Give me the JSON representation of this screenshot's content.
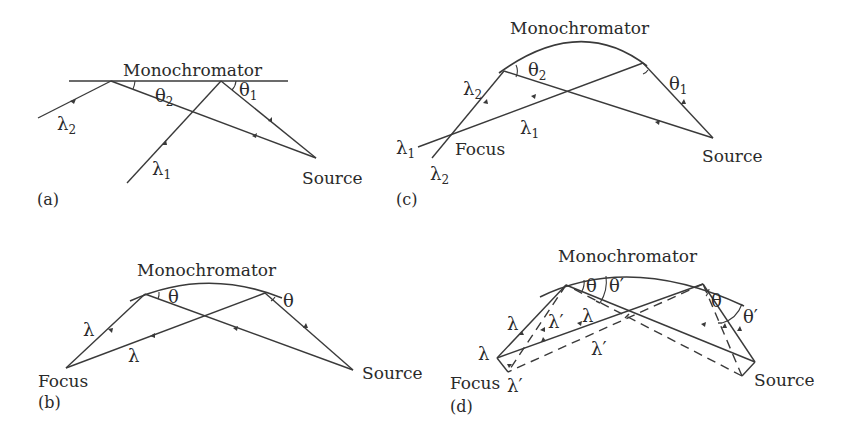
{
  "figure": {
    "panels": [
      {
        "id": "a",
        "label": "(a)",
        "type": "flat-crystal",
        "monochromator_label": "Monochromator",
        "source_label": "Source",
        "rays": [
          {
            "symbol": "λ",
            "subscript": "2",
            "angle_symbol": "θ",
            "angle_subscript": "2"
          },
          {
            "symbol": "λ",
            "subscript": "1",
            "angle_symbol": "θ",
            "angle_subscript": "1"
          }
        ]
      },
      {
        "id": "b",
        "label": "(b)",
        "type": "curved-crystal-single-wavelength",
        "monochromator_label": "Monochromator",
        "focus_label": "Focus",
        "source_label": "Source",
        "rays": [
          {
            "symbol": "λ",
            "angle_symbol": "θ"
          },
          {
            "symbol": "λ",
            "angle_symbol": "θ"
          }
        ]
      },
      {
        "id": "c",
        "label": "(c)",
        "type": "curved-crystal-two-wavelengths",
        "monochromator_label": "Monochromator",
        "focus_label": "Focus",
        "source_label": "Source",
        "rays": [
          {
            "symbol": "λ",
            "subscript": "2",
            "angle_symbol": "θ",
            "angle_subscript": "2"
          },
          {
            "symbol": "λ",
            "subscript": "1",
            "angle_symbol": "θ",
            "angle_subscript": "1"
          }
        ],
        "end_labels": [
          {
            "symbol": "λ",
            "subscript": "1"
          },
          {
            "symbol": "λ",
            "subscript": "2"
          }
        ]
      },
      {
        "id": "d",
        "label": "(d)",
        "type": "curved-crystal-extended-source",
        "monochromator_label": "Monochromator",
        "focus_label": "Focus",
        "source_label": "Source",
        "solid_ray": {
          "symbol": "λ",
          "angle_symbol": "θ"
        },
        "dashed_ray": {
          "symbol": "λ′",
          "angle_symbol": "θ′"
        },
        "labels": {
          "lambda": "λ",
          "lambda_prime": "λ′",
          "theta": "θ",
          "theta_prime": "θ′"
        }
      }
    ]
  }
}
